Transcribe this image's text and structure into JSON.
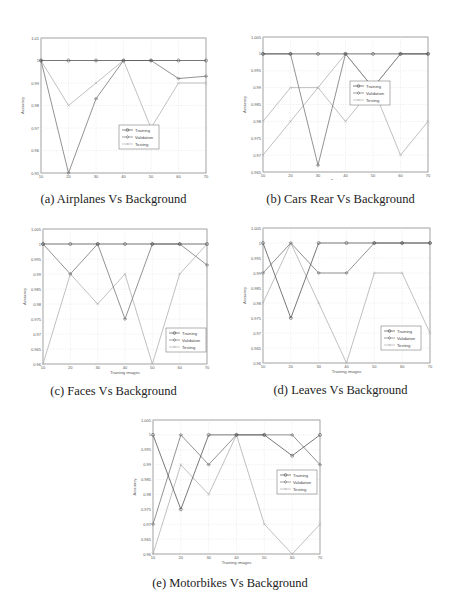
{
  "figure": {
    "series_names": [
      "Training",
      "Validation",
      "Testing"
    ],
    "series_colors": {
      "Training": "#555555",
      "Validation": "#777777",
      "Testing": "#b0b0b0"
    },
    "xlabel": "Training images",
    "ylabel": "Accuracy"
  },
  "chart_data": [
    {
      "type": "line",
      "id": "a",
      "title": "(a) Airplanes Vs Background",
      "xlabel": "Training images",
      "ylabel": "Accuracy",
      "x": [
        10,
        20,
        30,
        40,
        50,
        60,
        70
      ],
      "xlim": [
        10,
        70
      ],
      "ylim": [
        0.95,
        1.01
      ],
      "yticks": [
        0.95,
        0.96,
        0.97,
        0.98,
        0.99,
        1.0,
        1.01
      ],
      "ytick_labels": [
        "0.95",
        "0.96",
        "0.97",
        "0.98",
        "0.99",
        "1",
        "1.01"
      ],
      "grid": true,
      "legend_position": "lower right",
      "series": [
        {
          "name": "Training",
          "values": [
            1.0,
            1.0,
            1.0,
            1.0,
            1.0,
            1.0,
            1.0
          ]
        },
        {
          "name": "Validation",
          "values": [
            1.0,
            0.95,
            0.983,
            1.0,
            1.0,
            0.992,
            0.993
          ]
        },
        {
          "name": "Testing",
          "values": [
            1.0,
            0.98,
            0.99,
            1.0,
            0.97,
            0.99,
            0.99
          ]
        }
      ]
    },
    {
      "type": "line",
      "id": "b",
      "title": "(b) Cars Rear Vs Background",
      "xlabel": "Training images",
      "ylabel": "Accuracy",
      "x": [
        10,
        20,
        30,
        40,
        50,
        60,
        70
      ],
      "xlim": [
        10,
        70
      ],
      "ylim": [
        0.965,
        1.005
      ],
      "yticks": [
        0.965,
        0.97,
        0.975,
        0.98,
        0.985,
        0.99,
        0.995,
        1.0,
        1.005
      ],
      "ytick_labels": [
        "0.965",
        "0.97",
        "0.975",
        "0.98",
        "0.985",
        "0.99",
        "0.995",
        "1",
        "1.005"
      ],
      "grid": true,
      "legend_position": "center right",
      "series": [
        {
          "name": "Training",
          "values": [
            1.0,
            1.0,
            1.0,
            1.0,
            1.0,
            1.0,
            1.0
          ]
        },
        {
          "name": "Validation",
          "values": [
            1.0,
            1.0,
            0.967,
            1.0,
            0.99,
            1.0,
            1.0
          ]
        },
        {
          "name": "Testing",
          "values": [
            0.97,
            0.98,
            0.99,
            1.0,
            0.99,
            0.97,
            0.98
          ]
        },
        {
          "name": "Testing-2",
          "values": [
            0.98,
            0.99,
            0.99,
            0.98,
            0.99,
            1.0,
            1.0
          ]
        }
      ]
    },
    {
      "type": "line",
      "id": "c",
      "title": "(c) Faces Vs Background",
      "xlabel": "Training images",
      "ylabel": "Accuracy",
      "x": [
        10,
        20,
        30,
        40,
        50,
        60,
        70
      ],
      "xlim": [
        10,
        70
      ],
      "ylim": [
        0.96,
        1.005
      ],
      "yticks": [
        0.96,
        0.965,
        0.97,
        0.975,
        0.98,
        0.985,
        0.99,
        0.995,
        1.0,
        1.005
      ],
      "ytick_labels": [
        "0.96",
        "0.965",
        "0.97",
        "0.975",
        "0.98",
        "0.985",
        "0.99",
        "0.995",
        "1",
        "1.005"
      ],
      "grid": true,
      "legend_position": "lower right",
      "series": [
        {
          "name": "Training",
          "values": [
            1.0,
            1.0,
            1.0,
            1.0,
            1.0,
            1.0,
            1.0
          ]
        },
        {
          "name": "Validation",
          "values": [
            1.0,
            0.99,
            1.0,
            0.975,
            1.0,
            1.0,
            0.993
          ]
        },
        {
          "name": "Testing",
          "values": [
            0.96,
            0.99,
            0.98,
            0.99,
            0.96,
            0.99,
            1.0
          ]
        }
      ]
    },
    {
      "type": "line",
      "id": "d",
      "title": "(d) Leaves Vs Background",
      "xlabel": "Training images",
      "ylabel": "Accuracy",
      "x": [
        10,
        20,
        30,
        40,
        50,
        60,
        70
      ],
      "xlim": [
        10,
        70
      ],
      "ylim": [
        0.96,
        1.005
      ],
      "yticks": [
        0.96,
        0.965,
        0.97,
        0.975,
        0.98,
        0.985,
        0.99,
        0.995,
        1.0,
        1.005
      ],
      "ytick_labels": [
        "0.96",
        "0.965",
        "0.97",
        "0.975",
        "0.98",
        "0.985",
        "0.99",
        "0.995",
        "1",
        "1.005"
      ],
      "grid": true,
      "legend_position": "lower right",
      "series": [
        {
          "name": "Training",
          "values": [
            1.0,
            0.975,
            1.0,
            1.0,
            1.0,
            1.0,
            1.0
          ]
        },
        {
          "name": "Validation",
          "values": [
            0.99,
            1.0,
            0.99,
            0.99,
            1.0,
            1.0,
            1.0
          ]
        },
        {
          "name": "Testing",
          "values": [
            0.98,
            1.0,
            0.98,
            0.96,
            0.99,
            0.99,
            0.97
          ]
        }
      ]
    },
    {
      "type": "line",
      "id": "e",
      "title": "(e) Motorbikes Vs Background",
      "xlabel": "Training images",
      "ylabel": "Accuracy",
      "x": [
        10,
        20,
        30,
        40,
        50,
        60,
        70
      ],
      "xlim": [
        10,
        70
      ],
      "ylim": [
        0.96,
        1.005
      ],
      "yticks": [
        0.96,
        0.965,
        0.97,
        0.975,
        0.98,
        0.985,
        0.99,
        0.995,
        1.0,
        1.005
      ],
      "ytick_labels": [
        "0.96",
        "0.965",
        "0.97",
        "0.975",
        "0.98",
        "0.985",
        "0.99",
        "0.995",
        "1",
        "1.005"
      ],
      "grid": true,
      "legend_position": "center right",
      "series": [
        {
          "name": "Training",
          "values": [
            1.0,
            0.975,
            1.0,
            1.0,
            1.0,
            0.993,
            1.0
          ]
        },
        {
          "name": "Validation",
          "values": [
            0.97,
            1.0,
            0.99,
            1.0,
            1.0,
            1.0,
            0.99
          ]
        },
        {
          "name": "Testing",
          "values": [
            0.96,
            0.99,
            0.98,
            1.0,
            0.97,
            0.96,
            0.97
          ]
        }
      ]
    }
  ],
  "captions": {
    "a": "(a)  Airplanes Vs Background",
    "b": "(b)  Cars Rear Vs Background",
    "c": "(c)  Faces Vs Background",
    "d": "(d)  Leaves Vs Background",
    "e": "(e)  Motorbikes Vs Background"
  }
}
